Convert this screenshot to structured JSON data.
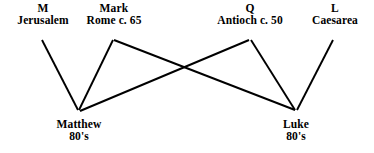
{
  "diagram": {
    "background_color": "#ffffff",
    "line_color": "#000000",
    "text_color": "#000000",
    "sources": {
      "m": {
        "symbol": "M",
        "place": "Jerusalem"
      },
      "mark": {
        "symbol": "Mark",
        "place": "Rome c. 65"
      },
      "q": {
        "symbol": "Q",
        "place": "Antioch c. 50"
      },
      "l": {
        "symbol": "L",
        "place": "Caesarea"
      }
    },
    "gospels": {
      "matthew": {
        "name": "Matthew",
        "date": "80's"
      },
      "luke": {
        "name": "Luke",
        "date": "80's"
      }
    },
    "edges": [
      {
        "from": "M",
        "to": "Matthew"
      },
      {
        "from": "Mark",
        "to": "Matthew"
      },
      {
        "from": "Mark",
        "to": "Luke"
      },
      {
        "from": "Q",
        "to": "Matthew"
      },
      {
        "from": "Q",
        "to": "Luke"
      },
      {
        "from": "L",
        "to": "Luke"
      }
    ]
  }
}
